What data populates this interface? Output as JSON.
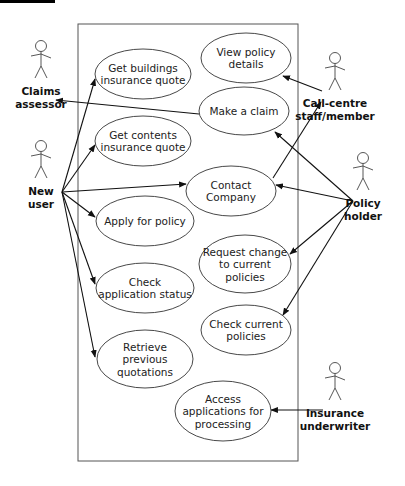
{
  "diagram": {
    "type": "uml-use-case",
    "system_box": {
      "x": 78,
      "y": 24,
      "w": 220,
      "h": 437
    },
    "colors": {
      "line": "#111111",
      "ellipse_stroke": "#333333",
      "text": "#222222",
      "header_bar": "#000000"
    },
    "actors": [
      {
        "id": "claims",
        "label": [
          "Claims",
          "assessor"
        ],
        "x": 41,
        "y": 68
      },
      {
        "id": "newuser",
        "label": [
          "New",
          "user"
        ],
        "x": 41,
        "y": 168
      },
      {
        "id": "callcentre",
        "label": [
          "Call-centre",
          "staff/member"
        ],
        "x": 335,
        "y": 80
      },
      {
        "id": "policyholder",
        "label": [
          "Policy",
          "holder"
        ],
        "x": 363,
        "y": 180
      },
      {
        "id": "underwriter",
        "label": [
          "Insurance",
          "underwriter"
        ],
        "x": 335,
        "y": 390
      }
    ],
    "use_cases": [
      {
        "id": "buildings",
        "lines": [
          "Get buildings",
          "insurance quote"
        ],
        "cx": 143,
        "cy": 74,
        "rx": 48,
        "ry": 25
      },
      {
        "id": "viewpolicy",
        "lines": [
          "View policy",
          "details"
        ],
        "cx": 246,
        "cy": 58,
        "rx": 45,
        "ry": 25
      },
      {
        "id": "claim",
        "lines": [
          "Make a claim"
        ],
        "cx": 244,
        "cy": 111,
        "rx": 45,
        "ry": 24
      },
      {
        "id": "contents",
        "lines": [
          "Get contents",
          "insurance quote"
        ],
        "cx": 143,
        "cy": 141,
        "rx": 48,
        "ry": 25
      },
      {
        "id": "contact",
        "lines": [
          "Contact",
          "Company"
        ],
        "cx": 231,
        "cy": 191,
        "rx": 45,
        "ry": 25
      },
      {
        "id": "apply",
        "lines": [
          "Apply for policy"
        ],
        "cx": 145,
        "cy": 221,
        "rx": 49,
        "ry": 25
      },
      {
        "id": "requestchange",
        "lines": [
          "Request change",
          "to current",
          "policies"
        ],
        "cx": 245,
        "cy": 264,
        "rx": 46,
        "ry": 29
      },
      {
        "id": "checkstatus",
        "lines": [
          "Check",
          "application status"
        ],
        "cx": 145,
        "cy": 288,
        "rx": 49,
        "ry": 25
      },
      {
        "id": "checkpolicies",
        "lines": [
          "Check current",
          "policies"
        ],
        "cx": 246,
        "cy": 330,
        "rx": 45,
        "ry": 25
      },
      {
        "id": "retrieve",
        "lines": [
          "Retrieve",
          "previous",
          "quotations"
        ],
        "cx": 145,
        "cy": 359,
        "rx": 48,
        "ry": 29
      },
      {
        "id": "access",
        "lines": [
          "Access",
          "applications for",
          "processing"
        ],
        "cx": 223,
        "cy": 411,
        "rx": 48,
        "ry": 30
      }
    ],
    "associations": [
      {
        "from": "newuser",
        "to": "buildings",
        "x1": 62,
        "y1": 192,
        "x2": 95,
        "y2": 79
      },
      {
        "from": "newuser",
        "to": "contents",
        "x1": 62,
        "y1": 192,
        "x2": 95,
        "y2": 145
      },
      {
        "from": "newuser",
        "to": "contact",
        "x1": 62,
        "y1": 192,
        "x2": 186,
        "y2": 184
      },
      {
        "from": "newuser",
        "to": "apply",
        "x1": 62,
        "y1": 192,
        "x2": 95,
        "y2": 217
      },
      {
        "from": "newuser",
        "to": "checkstatus",
        "x1": 62,
        "y1": 192,
        "x2": 95,
        "y2": 284
      },
      {
        "from": "newuser",
        "to": "retrieve",
        "x1": 62,
        "y1": 192,
        "x2": 95,
        "y2": 357
      },
      {
        "from": "claim",
        "to": "claims",
        "x1": 199,
        "y1": 114,
        "x2": 56,
        "y2": 100
      },
      {
        "from": "callcentre",
        "to": "viewpolicy",
        "x1": 322,
        "y1": 91,
        "x2": 283,
        "y2": 76
      },
      {
        "from": "contact",
        "to": "callcentre",
        "x1": 273,
        "y1": 178,
        "x2": 321,
        "y2": 102
      },
      {
        "from": "policyholder",
        "to": "claim",
        "x1": 353,
        "y1": 201,
        "x2": 275,
        "y2": 132
      },
      {
        "from": "policyholder",
        "to": "contact",
        "x1": 353,
        "y1": 201,
        "x2": 276,
        "y2": 185
      },
      {
        "from": "policyholder",
        "to": "requestchange",
        "x1": 353,
        "y1": 201,
        "x2": 290,
        "y2": 254
      },
      {
        "from": "policyholder",
        "to": "checkpolicies",
        "x1": 353,
        "y1": 201,
        "x2": 283,
        "y2": 315
      },
      {
        "from": "underwriter",
        "to": "access",
        "x1": 323,
        "y1": 410,
        "x2": 271,
        "y2": 410
      }
    ]
  }
}
